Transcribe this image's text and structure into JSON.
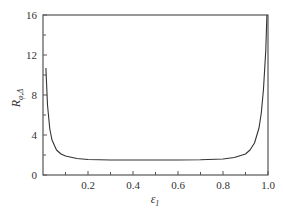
{
  "chart_data": {
    "type": "line",
    "title": "",
    "xlabel": "ε1",
    "ylabel": "Rφ,Δ",
    "xlim": [
      0,
      1.0
    ],
    "ylim": [
      0,
      16
    ],
    "grid": false,
    "legend": null,
    "x_ticks": [
      "0.2",
      "0.4",
      "0.6",
      "0.8",
      "1.0"
    ],
    "x_tick_values": [
      0.2,
      0.4,
      0.6,
      0.8,
      1.0
    ],
    "x_minor_ticks": [
      0.1,
      0.3,
      0.5,
      0.7,
      0.9
    ],
    "y_ticks": [
      "0",
      "4",
      "8",
      "12",
      "16"
    ],
    "y_tick_values": [
      0,
      4,
      8,
      12,
      16
    ],
    "y_minor_ticks": [
      2,
      6,
      10,
      14
    ],
    "series": [
      {
        "name": "R",
        "color": "#333333",
        "x": [
          0.013,
          0.02,
          0.03,
          0.04,
          0.06,
          0.08,
          0.1,
          0.15,
          0.2,
          0.3,
          0.4,
          0.5,
          0.6,
          0.7,
          0.8,
          0.85,
          0.9,
          0.92,
          0.94,
          0.96,
          0.97,
          0.98,
          0.99,
          0.995
        ],
        "y": [
          10.7,
          7.0,
          4.6,
          3.5,
          2.5,
          2.1,
          1.9,
          1.65,
          1.55,
          1.5,
          1.5,
          1.5,
          1.5,
          1.52,
          1.6,
          1.75,
          2.1,
          2.5,
          3.2,
          4.7,
          6.2,
          8.6,
          12.5,
          16.0
        ]
      }
    ]
  },
  "labels": {
    "xlabel_main": "ε",
    "xlabel_sub": "1",
    "ylabel_main": "R",
    "ylabel_sub": "φ,Δ"
  }
}
